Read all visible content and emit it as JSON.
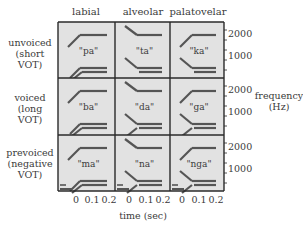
{
  "figure": {
    "columns": [
      "labial",
      "alveolar",
      "palatovelar"
    ],
    "rows": [
      {
        "label": [
          "unvoiced",
          "(short",
          "VOT)"
        ]
      },
      {
        "label": [
          "voiced",
          "(long",
          "VOT)"
        ]
      },
      {
        "label": [
          "prevoiced",
          "(negative",
          "VOT)"
        ]
      }
    ],
    "y_axis": {
      "label": [
        "frequency",
        "(Hz)"
      ],
      "ticks": [
        "2000",
        "1000"
      ]
    },
    "x_axis": {
      "label": "time (sec)",
      "ticks": [
        "0",
        "0.1",
        "0.2"
      ]
    },
    "colors": {
      "cell_bg": "#e2e2e2",
      "grid": "#2a2a2a",
      "formant": "#555555"
    },
    "cells": [
      [
        {
          "syllable": "\"pa\"",
          "f2": "rising",
          "f1": "rising",
          "prevoicing": false
        },
        {
          "syllable": "\"ta\"",
          "f2": "falling",
          "f1": "falling",
          "prevoicing": false
        },
        {
          "syllable": "\"ka\"",
          "f2": "rising",
          "f1": "falling",
          "prevoicing": false
        }
      ],
      [
        {
          "syllable": "\"ba\"",
          "f2": "rising",
          "f1": "rising",
          "prevoicing": false
        },
        {
          "syllable": "\"da\"",
          "f2": "falling",
          "f1": "converging",
          "prevoicing": false
        },
        {
          "syllable": "\"ga\"",
          "f2": "rising",
          "f1": "converging",
          "prevoicing": false
        }
      ],
      [
        {
          "syllable": "\"ma\"",
          "f2": "rising",
          "f1": "rising",
          "prevoicing": true
        },
        {
          "syllable": "\"na\"",
          "f2": "falling",
          "f1": "converging",
          "prevoicing": true
        },
        {
          "syllable": "\"nga\"",
          "f2": "rising",
          "f1": "converging",
          "prevoicing": true
        }
      ]
    ]
  }
}
